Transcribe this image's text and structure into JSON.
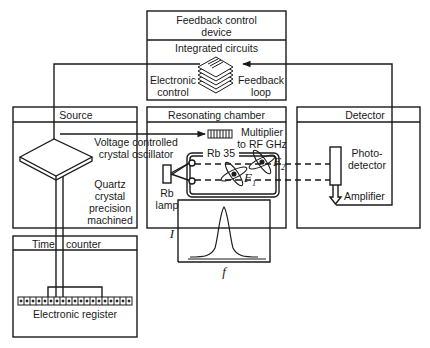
{
  "diagram": {
    "feedback_device": {
      "title_line1": "Feedback control",
      "title_line2": "device",
      "subtitle": "Integrated circuits",
      "left_label_1": "Electronic",
      "left_label_2": "control",
      "right_label_1": "Feedback",
      "right_label_2": "loop",
      "icon": "integrated-circuit-stack-icon"
    },
    "source": {
      "title": "Source",
      "oscillator_label_1": "Voltage controlled",
      "oscillator_label_2": "crystal oscillator",
      "crystal_label_1": "Quartz",
      "crystal_label_2": "crystal",
      "crystal_label_3": "precision",
      "crystal_label_4": "machined",
      "icon": "quartz-crystal-icon"
    },
    "resonating_chamber": {
      "title": "Resonating chamber",
      "multiplier_label_1": "Multiplier",
      "multiplier_label_2": "to RF GHz",
      "cell_label": "Rb 35",
      "lamp_label_1": "Rb",
      "lamp_label_2": "lamp",
      "state_upper": "F",
      "state_upper_sub": "2",
      "state_lower": "F",
      "state_lower_sub": "1",
      "plot_y_label": "I",
      "plot_x_label": "f"
    },
    "detector": {
      "title": "Detector",
      "photo_label_1": "Photo-",
      "photo_label_2": "detector",
      "amplifier_label": "Amplifier"
    },
    "time_counter": {
      "title_left": "Time",
      "title_right": "counter",
      "register_label": "Electronic register",
      "register_cells": 19
    },
    "colors": {
      "line": "#1a1a1a",
      "background": "#ffffff"
    }
  }
}
